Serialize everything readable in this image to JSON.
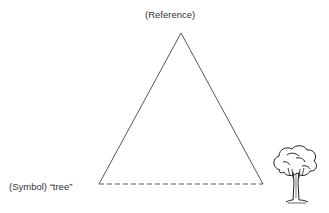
{
  "diagram": {
    "labels": {
      "reference": "(Reference)",
      "symbol": "(Symbol) “tree”"
    },
    "referent_icon": "tree-icon",
    "colors": {
      "line": "#444444",
      "text": "#333333",
      "background": "#ffffff"
    }
  }
}
